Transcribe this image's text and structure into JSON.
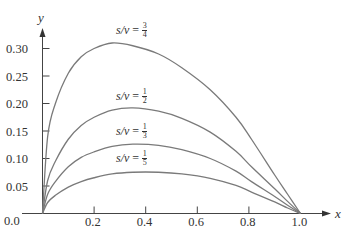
{
  "chart_data": {
    "type": "line",
    "title": "",
    "xlabel": "x",
    "ylabel": "y",
    "xlim": [
      0.0,
      1.0
    ],
    "ylim": [
      0.0,
      0.32
    ],
    "grid": false,
    "legend": "inline labels next to curves",
    "x_ticks": [
      "0.0",
      "0.2",
      "0.4",
      "0.6",
      "0.8",
      "1.0"
    ],
    "y_ticks": [
      "0.0",
      "0.05",
      "0.10",
      "0.15",
      "0.20",
      "0.25",
      "0.30"
    ],
    "x": [
      0.0,
      0.02,
      0.05,
      0.1,
      0.15,
      0.2,
      0.27,
      0.35,
      0.45,
      0.54,
      0.65,
      0.75,
      0.81,
      0.9,
      0.95,
      1.0
    ],
    "series": [
      {
        "name": "s/v = 3/4",
        "label_lhs": "s/v",
        "label_num": "3",
        "label_den": "4",
        "values": [
          0.0,
          0.14,
          0.2,
          0.255,
          0.285,
          0.3,
          0.31,
          0.305,
          0.29,
          0.265,
          0.225,
          0.175,
          0.135,
          0.07,
          0.035,
          0.0
        ]
      },
      {
        "name": "s/v = 1/2",
        "label_lhs": "s/v",
        "label_num": "1",
        "label_den": "2",
        "values": [
          0.0,
          0.06,
          0.095,
          0.135,
          0.16,
          0.175,
          0.188,
          0.192,
          0.186,
          0.173,
          0.148,
          0.113,
          0.085,
          0.045,
          0.022,
          0.0
        ]
      },
      {
        "name": "s/v = 1/3",
        "label_lhs": "s/v",
        "label_num": "1",
        "label_den": "3",
        "values": [
          0.0,
          0.035,
          0.058,
          0.085,
          0.102,
          0.112,
          0.122,
          0.126,
          0.124,
          0.116,
          0.1,
          0.077,
          0.058,
          0.031,
          0.015,
          0.0
        ]
      },
      {
        "name": "s/v = 1/5",
        "label_lhs": "s/v",
        "label_num": "1",
        "label_den": "5",
        "values": [
          0.0,
          0.02,
          0.033,
          0.048,
          0.058,
          0.065,
          0.072,
          0.075,
          0.075,
          0.072,
          0.064,
          0.051,
          0.039,
          0.021,
          0.01,
          0.0
        ]
      }
    ]
  },
  "labels": {
    "eq": "="
  }
}
